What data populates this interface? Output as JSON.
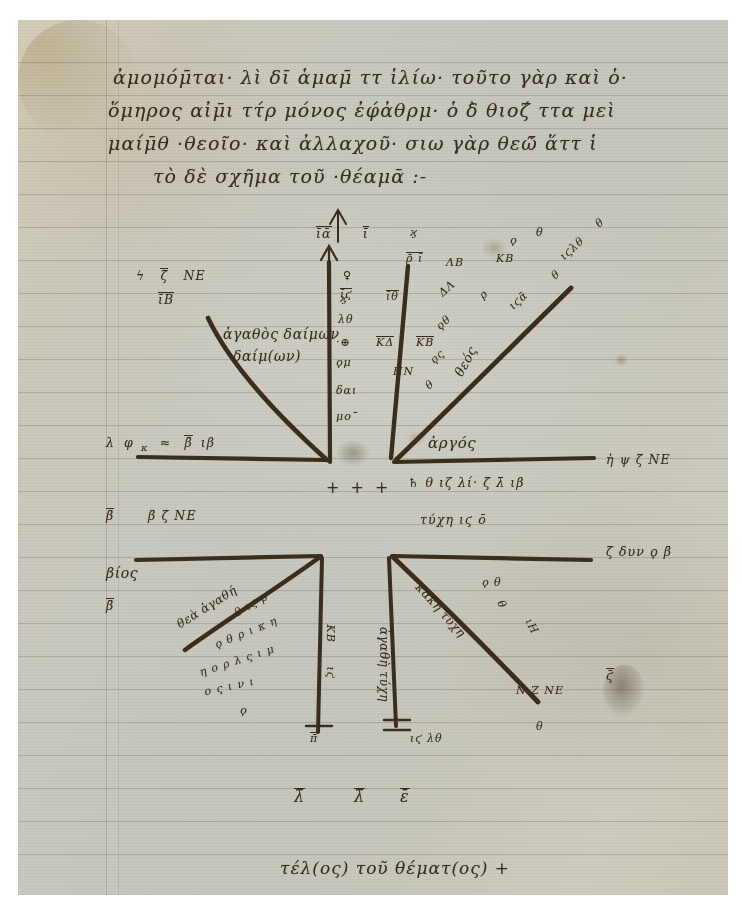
{
  "manuscript": {
    "kind": "byzantine-greek-horoscope-diagram",
    "ink_color": "#3a2d1e",
    "parchment_color": "#c9c8bd"
  },
  "header": {
    "lines": [
      "ἀμομόμ̄ται· λὶ δῑ ἁμαμ̄ ττ ἱλίω·  τοῦτο γὰρ καὶ ὁ·",
      "ὅμηρος αἰμ̄ι ττ́ρ μόνος ἐφ́ἀθρμ· ὁ δ̀ θιοζ́ ττα μεὶ",
      "μαίμ̄θ ·θεοῖο· καὶ ἀλλαχοῦ· σιω γὰρ θεῶ̄ ἅττ ἱ",
      "τὸ δὲ σχῆμα τοῦ ·θέαμᾱ :-"
    ]
  },
  "diagram": {
    "title_note": "horoscope square-diagram with four angular wedges",
    "upper_left": {
      "corner_label": "ἀγαθὸς δαίμων",
      "corner_label_line2": "δαίμ(ων)",
      "outer_numerals": [
        "ϟ",
        "ζ̄",
        "ΝΕ",
        "ῑΒ"
      ],
      "baseline_numerals": [
        "λ",
        "φ",
        "κ",
        "≈",
        "β̄",
        "ιβ"
      ]
    },
    "upper_center": {
      "apex_numerals": [
        "ῑᾱ",
        "ῑ"
      ],
      "column_rows": [
        [
          "↑",
          "♀"
        ],
        [
          "ῑϛ",
          "♃"
        ],
        [
          "λθ",
          "—"
        ],
        [
          "·⊕",
          "ΚΔ",
          "ΚΒ"
        ],
        [
          "ϙμ",
          ""
        ],
        [
          "",
          "ΗΝ"
        ],
        [
          "δαι",
          ""
        ],
        [
          "μο¯",
          ""
        ]
      ]
    },
    "upper_right": {
      "apex_numerals": [
        "ρ̄ ῑ",
        "ΛΒ",
        "ΚΒ",
        "θ"
      ],
      "diagonal_text": "θεός",
      "diagonal_numerals": [
        "ιϛᾱ",
        "θ",
        "ιϛλθ",
        "θ"
      ],
      "wedge_numerals": [
        "ΔΛ",
        "ρ",
        "θ",
        "θ"
      ]
    },
    "center_axis": {
      "left_field_label": "ἀργός",
      "crosses": "+ + +",
      "center_line_top": "♄ θ ιζ λί· ζ̄ λ̄ ιβ",
      "center_line_bottom": "τύχη ιϛ ο̄",
      "right_top_label": "ἠ ψ ζ̄ ΝΕ",
      "right_bottom_label": "ζ̄ δυν ϙ β̄"
    },
    "left_margin": {
      "items": [
        "β̄",
        "β̄ ζ̄ ΝΕ",
        "βίος",
        "β̄"
      ]
    },
    "lower_left": {
      "diagonal_text": "θεὰ ἀγαθή",
      "cluster_lines": [
        "θ ιϛ ρ",
        "ϙ θ ρ ι κ η",
        "η ο ρ λ ς ι μ",
        "ο ς ι ν ι",
        "ϙ"
      ],
      "stem_numerals": [
        "θ",
        "ιϛ",
        "ΚΒ"
      ],
      "foot_numeral": "π̄"
    },
    "lower_right": {
      "diagonal_text": "κακὴ τύχη",
      "stem_text": "ἀγαθὴ τύχη",
      "cluster_lines": [
        "ϙ θ",
        "θ",
        "ιΗ",
        "Ν Ζ ΝΕ",
        "θ"
      ],
      "foot_numerals": [
        "ιϛ λθ"
      ],
      "right_numeral": "ϛ̄"
    },
    "bottom_row": {
      "numerals": [
        "λ̄",
        "λ̄",
        "ε̄"
      ]
    },
    "colophon": "τέλ(ος) τοῦ θέματ(ος) +"
  }
}
